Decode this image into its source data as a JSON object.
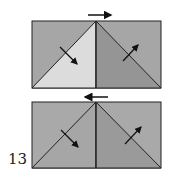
{
  "diagram": {
    "step_number": "13",
    "colors": {
      "dark_gray": "#a9a9a9",
      "mid_gray": "#999999",
      "light_gray": "#dcdcdc",
      "medium_gray": "#a3a3a3",
      "outline": "#222222"
    },
    "panels": [
      {
        "name": "top-panel",
        "top_arrow": "right"
      },
      {
        "name": "bottom-panel",
        "top_arrow": "left"
      }
    ]
  }
}
